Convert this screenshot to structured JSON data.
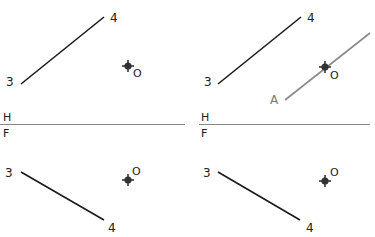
{
  "diagram": {
    "colors": {
      "line": "#1a1a1a",
      "auxiliary_line": "#8a8a8a",
      "fold_line": "#888888",
      "marker": "#333333"
    },
    "fold_line_labels": {
      "top": "H",
      "bottom": "F"
    },
    "panels": [
      {
        "id": "left",
        "top_view": {
          "point_start_label": "3",
          "point_end_label": "4",
          "point_o_label": "O"
        },
        "front_view": {
          "point_start_label": "3",
          "point_end_label": "4",
          "point_o_label": "O"
        }
      },
      {
        "id": "right",
        "top_view": {
          "point_start_label": "3",
          "point_end_label": "4",
          "point_o_label": "O",
          "auxiliary_line_label": "A"
        },
        "front_view": {
          "point_start_label": "3",
          "point_end_label": "4",
          "point_o_label": "O"
        }
      }
    ]
  }
}
